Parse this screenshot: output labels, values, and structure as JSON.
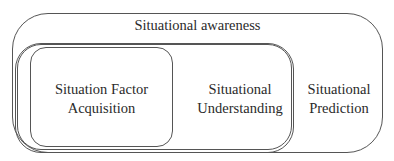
{
  "diagram": {
    "title": "Situational awareness",
    "nodes": [
      {
        "id": "acquisition",
        "label_line1": "Situation Factor",
        "label_line2": "Acquisition"
      },
      {
        "id": "understanding",
        "label_line1": "Situational",
        "label_line2": "Understanding"
      },
      {
        "id": "prediction",
        "label_line1": "Situational",
        "label_line2": "Prediction"
      }
    ],
    "colors": {
      "stroke": "#555555",
      "text": "#2a2a2a",
      "background": "#ffffff"
    }
  }
}
